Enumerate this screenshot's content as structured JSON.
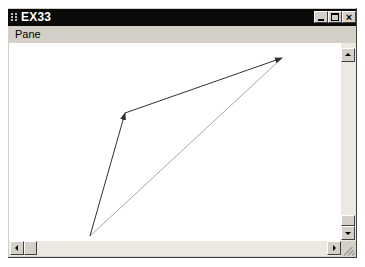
{
  "window": {
    "title": "EX33",
    "icon": "app-icon",
    "controls": {
      "minimize": {
        "icon": "minimize-icon",
        "glyph": "_"
      },
      "maximize": {
        "icon": "maximize-icon",
        "glyph": "□"
      },
      "close": {
        "icon": "close-icon",
        "glyph": "×"
      }
    },
    "title_bar_color": "#0a0a0a"
  },
  "menu": {
    "items": [
      {
        "label": "Pane"
      }
    ]
  },
  "canvas": {
    "background": "#ffffff",
    "lines": [
      {
        "from": [
          90,
          236
        ],
        "to": [
          125,
          113
        ],
        "color": "#303030",
        "arrowhead": true
      },
      {
        "from": [
          125,
          113
        ],
        "to": [
          282,
          58
        ],
        "color": "#303030",
        "arrowhead": true
      },
      {
        "from": [
          90,
          236
        ],
        "to": [
          282,
          58
        ],
        "color": "#a0a0a0",
        "arrowhead": false
      }
    ]
  },
  "scrollbars": {
    "vertical": {
      "up_icon": "scroll-up-arrow-icon",
      "down_icon": "scroll-down-arrow-icon",
      "thumb_position": "bottom"
    },
    "horizontal": {
      "left_icon": "scroll-left-arrow-icon",
      "right_icon": "scroll-right-arrow-icon",
      "thumb_position": "left"
    }
  }
}
